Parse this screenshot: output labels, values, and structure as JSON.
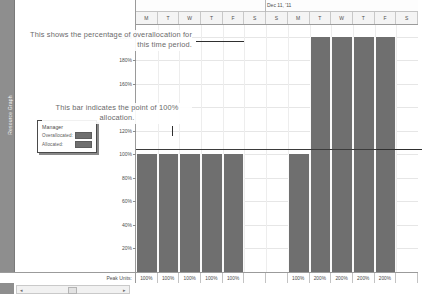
{
  "app": {
    "view_name": "Resource Graph"
  },
  "left_pane": {
    "vertical_label": "Resource Graph",
    "legend": {
      "title": "Manager",
      "rows": [
        {
          "label": "Overallocated:",
          "color": "#6f6f6f"
        },
        {
          "label": "Allocated:",
          "color": "#6f6f6f"
        }
      ]
    }
  },
  "timescale": {
    "major_label": "Dec 11, '11",
    "minor_labels": [
      "M",
      "T",
      "W",
      "T",
      "F",
      "S",
      "S",
      "M",
      "T",
      "W",
      "T",
      "F",
      "S"
    ]
  },
  "annotations": [
    {
      "text": "This shows the percentage of overallocation for this time period."
    },
    {
      "text": "This bar indicates the point of 100% allocation."
    }
  ],
  "peak_units": {
    "label": "Peak Units:",
    "values": [
      "100%",
      "100%",
      "100%",
      "100%",
      "100%",
      "",
      "",
      "100%",
      "200%",
      "200%",
      "200%",
      "200%",
      ""
    ]
  },
  "scrollbar": {
    "left_arrow": "◂",
    "right_arrow": "▸"
  },
  "chart_data": {
    "type": "bar",
    "xlabel": "",
    "ylabel": "Percent Allocated",
    "categories": [
      "M",
      "T",
      "W",
      "T",
      "F",
      "S",
      "S",
      "M",
      "T",
      "W",
      "T",
      "F",
      "S"
    ],
    "values": [
      100,
      100,
      100,
      100,
      100,
      0,
      0,
      100,
      200,
      200,
      200,
      200,
      0
    ],
    "ylim": [
      0,
      210
    ],
    "yticks": [
      20,
      40,
      60,
      80,
      100,
      120,
      140,
      160,
      180,
      200
    ],
    "ytick_labels": [
      "20%",
      "40%",
      "60%",
      "80%",
      "100%",
      "120%",
      "140%",
      "160%",
      "180%",
      "200%"
    ],
    "grid": true,
    "legend_position": "left-panel",
    "series": [
      {
        "name": "Overallocated",
        "color": "#6f6f6f"
      },
      {
        "name": "Allocated",
        "color": "#6f6f6f"
      }
    ],
    "reference_line": {
      "value": 100,
      "label": "100% allocation",
      "color": "#3b3b3b"
    },
    "bar_color": "#6f6f6f"
  }
}
